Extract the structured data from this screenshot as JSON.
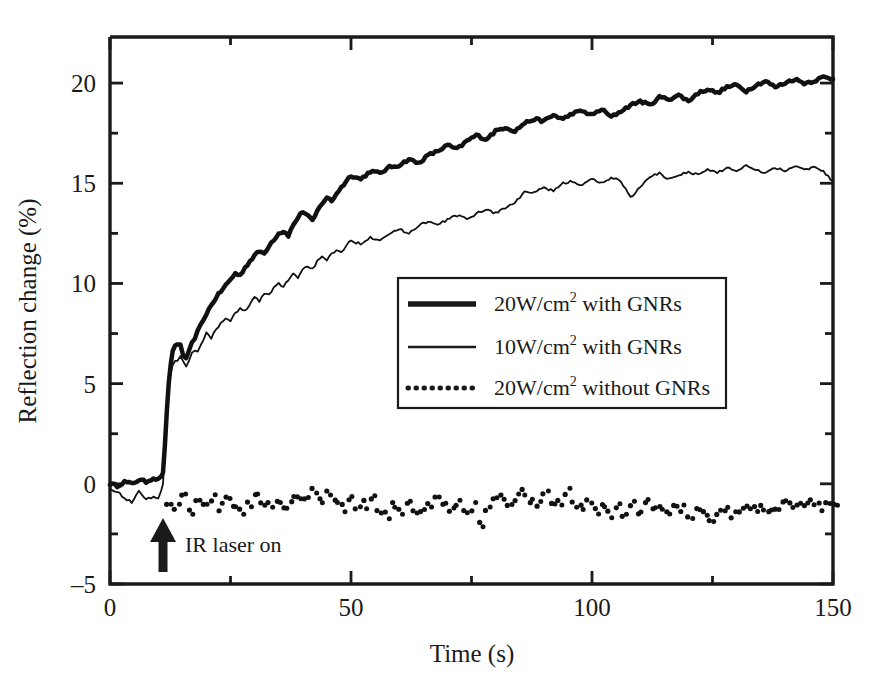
{
  "figure": {
    "background": "#ffffff",
    "ink_color": "#1a1a1a"
  },
  "axes": {
    "x_title": "Time (s)",
    "y_title": "Reflection change (%)",
    "x_ticks_major": [
      "0",
      "50",
      "100",
      "150"
    ],
    "y_ticks_major": [
      "-5",
      "0",
      "5",
      "10",
      "15",
      "20"
    ]
  },
  "legend": {
    "items": [
      {
        "style": "thick-solid",
        "power": "20W/cm",
        "exponent": "2",
        "rest": " with GNRs",
        "full": "20W/cm2 with GNRs"
      },
      {
        "style": "thin-solid",
        "power": "10W/cm",
        "exponent": "2",
        "rest": " with GNRs",
        "full": "10W/cm2 with GNRs"
      },
      {
        "style": "dotted",
        "power": "20W/cm",
        "exponent": "2",
        "rest": " without GNRs",
        "full": "20W/cm2 without GNRs"
      }
    ]
  },
  "annotations": [
    {
      "name": "ir-laser-on",
      "label": "IR laser on",
      "x": 11,
      "arrow": "up"
    }
  ],
  "chart_data": {
    "type": "line",
    "title": "",
    "xlabel": "Time (s)",
    "ylabel": "Reflection change (%)",
    "xlim": [
      0,
      150
    ],
    "ylim": [
      -5,
      22.3
    ],
    "xticks": [
      0,
      25,
      50,
      75,
      100,
      125,
      150
    ],
    "xticks_major": [
      0,
      50,
      100,
      150
    ],
    "yticks": [
      -5,
      -2.5,
      0,
      2.5,
      5,
      7.5,
      10,
      12.5,
      15,
      17.5,
      20
    ],
    "yticks_major": [
      -5,
      0,
      5,
      10,
      15,
      20
    ],
    "grid": false,
    "legend_position": "center-right",
    "laser_on_time": 11,
    "series": [
      {
        "name": "20W/cm2 with GNRs",
        "style": "thick-solid",
        "linewidth": 4.5,
        "color": "#111111",
        "x": [
          0,
          1.5,
          3,
          4.5,
          6,
          7.5,
          9,
          10,
          10.6,
          11,
          11.4,
          11.8,
          12.2,
          12.6,
          13,
          13.5,
          14,
          14.6,
          15.2,
          15.8,
          16.4,
          17,
          17.6,
          18.2,
          18.8,
          19.4,
          20,
          21,
          22,
          23,
          24,
          25,
          26,
          27,
          28,
          29,
          30,
          31,
          32,
          33,
          34,
          35,
          36,
          37,
          38,
          39,
          40,
          41,
          42,
          43,
          44,
          45,
          46,
          47,
          48,
          49,
          50,
          52,
          54,
          56,
          58,
          60,
          62,
          64,
          66,
          68,
          70,
          72,
          74,
          76,
          78,
          80,
          82,
          84,
          86,
          88,
          90,
          92,
          94,
          96,
          98,
          100,
          102,
          104,
          106,
          108,
          110,
          112,
          114,
          116,
          118,
          120,
          122,
          124,
          126,
          128,
          130,
          132,
          134,
          136,
          138,
          140,
          142,
          144,
          146,
          148,
          150
        ],
        "y": [
          0.0,
          -0.1,
          0.1,
          0.0,
          0.2,
          0.1,
          0.3,
          0.2,
          0.4,
          0.5,
          2.0,
          3.6,
          5.0,
          6.0,
          6.6,
          6.9,
          7.0,
          6.9,
          6.4,
          6.2,
          6.6,
          7.0,
          7.3,
          7.6,
          7.9,
          8.2,
          8.5,
          8.9,
          9.3,
          9.6,
          9.9,
          10.2,
          10.5,
          10.4,
          10.8,
          11.1,
          11.4,
          11.6,
          11.5,
          11.9,
          12.2,
          12.5,
          12.6,
          12.4,
          12.9,
          13.3,
          13.6,
          13.4,
          13.1,
          13.6,
          14.0,
          14.3,
          14.1,
          14.5,
          14.8,
          15.1,
          15.4,
          15.2,
          15.6,
          15.5,
          15.8,
          15.9,
          16.2,
          16.0,
          16.4,
          16.6,
          16.9,
          16.7,
          17.1,
          17.4,
          17.2,
          17.6,
          17.8,
          17.6,
          18.0,
          18.2,
          18.1,
          18.4,
          18.2,
          18.5,
          18.6,
          18.4,
          18.7,
          18.3,
          18.6,
          18.9,
          19.1,
          18.9,
          19.3,
          19.2,
          19.4,
          19.1,
          19.5,
          19.7,
          19.5,
          19.8,
          19.9,
          19.6,
          19.9,
          20.1,
          19.8,
          20.0,
          20.2,
          20.0,
          20.1,
          20.3,
          20.2
        ]
      },
      {
        "name": "10W/cm2 with GNRs",
        "style": "thin-solid",
        "linewidth": 1.8,
        "color": "#111111",
        "x": [
          0,
          1.5,
          3,
          4.5,
          6,
          7.5,
          9,
          10,
          10.6,
          11,
          11.4,
          11.8,
          12.2,
          12.6,
          13,
          13.5,
          14,
          14.6,
          15.2,
          15.8,
          16.4,
          17,
          17.6,
          18.2,
          18.8,
          19.4,
          20,
          21,
          22,
          23,
          24,
          25,
          26,
          27,
          28,
          29,
          30,
          31,
          32,
          33,
          34,
          35,
          36,
          37,
          38,
          39,
          40,
          41,
          42,
          43,
          44,
          45,
          46,
          47,
          48,
          49,
          50,
          52,
          54,
          56,
          58,
          60,
          62,
          64,
          66,
          68,
          70,
          72,
          74,
          76,
          78,
          80,
          82,
          84,
          86,
          88,
          90,
          92,
          94,
          96,
          98,
          100,
          102,
          104,
          106,
          108,
          110,
          112,
          114,
          116,
          118,
          120,
          122,
          124,
          126,
          128,
          130,
          132,
          134,
          136,
          138,
          140,
          142,
          144,
          146,
          148,
          150
        ],
        "y": [
          -0.2,
          -0.4,
          -0.7,
          -0.9,
          -0.4,
          -0.8,
          -0.6,
          -0.7,
          -0.4,
          0.0,
          1.8,
          3.4,
          4.7,
          5.5,
          5.9,
          6.1,
          6.2,
          6.4,
          6.1,
          5.8,
          6.1,
          6.5,
          6.7,
          6.6,
          6.9,
          7.2,
          7.5,
          7.3,
          7.7,
          8.0,
          8.3,
          8.1,
          8.5,
          8.8,
          8.6,
          9.0,
          9.3,
          9.1,
          9.5,
          9.4,
          9.8,
          10.0,
          9.8,
          10.2,
          10.5,
          10.3,
          10.7,
          10.9,
          10.7,
          11.1,
          11.3,
          11.1,
          11.5,
          11.7,
          11.5,
          11.9,
          12.1,
          12.0,
          12.3,
          12.2,
          12.5,
          12.7,
          12.5,
          12.9,
          13.1,
          12.9,
          13.2,
          13.4,
          13.2,
          13.5,
          13.7,
          13.5,
          13.8,
          14.0,
          14.6,
          14.5,
          14.8,
          14.6,
          15.0,
          15.1,
          14.9,
          15.2,
          15.0,
          15.3,
          15.1,
          14.3,
          14.8,
          15.3,
          15.5,
          15.2,
          15.4,
          15.6,
          15.4,
          15.7,
          15.5,
          15.8,
          15.6,
          15.9,
          15.7,
          15.5,
          15.8,
          15.6,
          15.9,
          15.7,
          15.8,
          15.6,
          15.1
        ]
      },
      {
        "name": "20W/cm2 without GNRs",
        "style": "dotted",
        "linewidth": 4.0,
        "color": "#111111",
        "x": [
          12,
          13.5,
          15,
          16.5,
          18,
          19.5,
          21,
          22.5,
          24,
          25.5,
          27,
          28.5,
          30,
          31.5,
          33,
          34.5,
          36,
          37.5,
          39,
          40.5,
          42,
          43.5,
          45,
          46.5,
          48,
          49.5,
          51,
          52.5,
          54,
          55.5,
          57,
          58.5,
          60,
          61.5,
          63,
          64.5,
          66,
          67.5,
          69,
          70.5,
          72,
          73.5,
          75,
          76.5,
          78,
          79.5,
          81,
          82.5,
          84,
          85.5,
          87,
          88.5,
          90,
          91.5,
          93,
          94.5,
          96,
          97.5,
          99,
          100.5,
          102,
          103.5,
          105,
          106.5,
          108,
          109.5,
          111,
          112.5,
          114,
          115.5,
          117,
          118.5,
          120,
          121.5,
          123,
          124.5,
          126,
          127.5,
          129,
          130.5,
          132,
          133.5,
          135,
          136.5,
          138,
          139.5,
          141,
          142.5,
          144,
          145.5,
          147,
          148.5,
          150
        ],
        "y": [
          -0.9,
          -1.2,
          -0.7,
          -1.3,
          -0.9,
          -1.1,
          -0.8,
          -1.2,
          -0.6,
          -1.0,
          -1.3,
          -0.9,
          -0.4,
          -0.8,
          -1.1,
          -0.7,
          -1.2,
          -0.9,
          -0.5,
          -0.9,
          -0.4,
          -0.8,
          -0.5,
          -0.9,
          -1.2,
          -0.8,
          -1.4,
          -1.0,
          -0.6,
          -1.2,
          -1.5,
          -1.0,
          -1.3,
          -0.9,
          -1.2,
          -1.4,
          -1.0,
          -0.5,
          -0.9,
          -1.3,
          -0.9,
          -1.5,
          -1.2,
          -2.0,
          -1.4,
          -0.9,
          -0.6,
          -1.0,
          -0.7,
          -0.4,
          -0.8,
          -1.1,
          -0.6,
          -1.0,
          -0.8,
          -0.5,
          -0.9,
          -1.2,
          -0.9,
          -1.3,
          -1.0,
          -1.5,
          -1.2,
          -1.5,
          -1.1,
          -1.4,
          -1.0,
          -1.3,
          -1.1,
          -1.4,
          -1.0,
          -1.3,
          -1.6,
          -1.2,
          -1.5,
          -1.9,
          -1.5,
          -1.2,
          -1.6,
          -1.3,
          -1.0,
          -1.3,
          -1.1,
          -1.4,
          -1.1,
          -0.8,
          -1.1,
          -0.9,
          -1.2,
          -0.9,
          -1.1,
          -0.8,
          -1.0
        ]
      }
    ]
  }
}
